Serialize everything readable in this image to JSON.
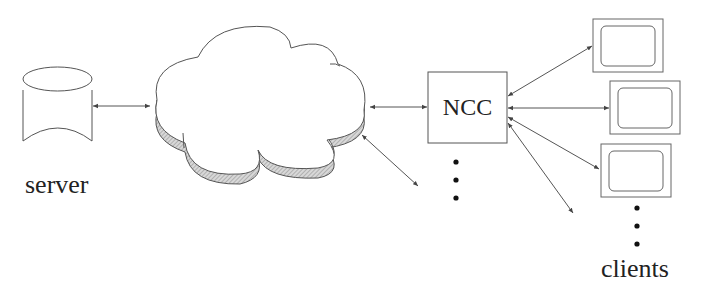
{
  "diagram": {
    "nodes": {
      "server": {
        "label": "server",
        "shape": "cylinder"
      },
      "network": {
        "label": "",
        "shape": "cloud"
      },
      "ncc": {
        "label": "NCC",
        "shape": "box"
      },
      "clients": {
        "label": "clients",
        "shape": "monitor",
        "count_shown": 3
      }
    },
    "edges": [
      {
        "from": "server",
        "to": "network",
        "type": "bidirectional"
      },
      {
        "from": "network",
        "to": "ncc",
        "type": "bidirectional"
      },
      {
        "from": "network",
        "to": "more-ncc",
        "type": "bidirectional",
        "note": "diagonal line toward additional NCCs"
      },
      {
        "from": "ncc",
        "to": "client-1",
        "type": "bidirectional"
      },
      {
        "from": "ncc",
        "to": "client-2",
        "type": "bidirectional"
      },
      {
        "from": "ncc",
        "to": "client-3",
        "type": "bidirectional"
      },
      {
        "from": "ncc",
        "to": "more-clients",
        "type": "bidirectional"
      }
    ],
    "ellipses": [
      {
        "position": "below-ncc",
        "meaning": "more NCCs"
      },
      {
        "position": "below-clients",
        "meaning": "more clients"
      }
    ]
  }
}
